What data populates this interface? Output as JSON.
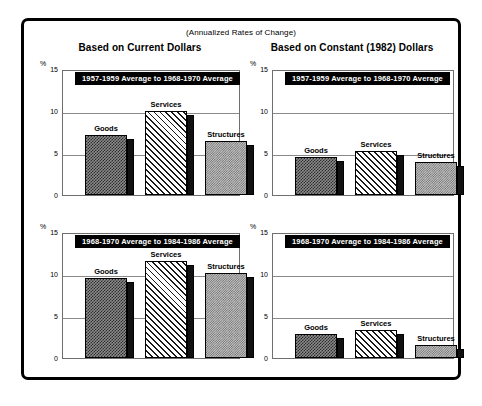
{
  "figure": {
    "subtitle": "(Annualized Rates of Change)",
    "column_headings": [
      "Based on Current Dollars",
      "Based on Constant (1982) Dollars"
    ]
  },
  "chart_data": [
    {
      "type": "bar",
      "panel_id": "current-1957-1968",
      "title": "1957-1959 Average to 1968-1970 Average",
      "column_heading": "Based on Current Dollars",
      "categories": [
        "Goods",
        "Services",
        "Structures"
      ],
      "values": [
        7.1,
        10.0,
        6.4
      ],
      "xlabel": "",
      "ylabel": "%",
      "ylim": [
        0,
        15
      ],
      "yticks": [
        0,
        5,
        10,
        15
      ],
      "ytick_labels": [
        "0",
        "5",
        "10",
        "15"
      ],
      "grid": true,
      "legend": "none"
    },
    {
      "type": "bar",
      "panel_id": "constant-1957-1968",
      "title": "1957-1959 Average to 1968-1970 Average",
      "column_heading": "Based on Constant (1982) Dollars",
      "categories": [
        "Goods",
        "Services",
        "Structures"
      ],
      "values": [
        4.5,
        5.2,
        3.9
      ],
      "xlabel": "",
      "ylabel": "%",
      "ylim": [
        0,
        15
      ],
      "yticks": [
        0,
        5,
        10,
        15
      ],
      "ytick_labels": [
        "0",
        "5",
        "10",
        "15"
      ],
      "grid": true,
      "legend": "none"
    },
    {
      "type": "bar",
      "panel_id": "current-1968-1984",
      "title": "1968-1970 Average to 1984-1986 Average",
      "column_heading": "Based on Current Dollars",
      "categories": [
        "Goods",
        "Services",
        "Structures"
      ],
      "values": [
        9.5,
        11.6,
        10.1
      ],
      "xlabel": "",
      "ylabel": "%",
      "ylim": [
        0,
        15
      ],
      "yticks": [
        0,
        5,
        10,
        15
      ],
      "ytick_labels": [
        "0",
        "5",
        "10",
        "15"
      ],
      "grid": true,
      "legend": "none"
    },
    {
      "type": "bar",
      "panel_id": "constant-1968-1984",
      "title": "1968-1970 Average to 1984-1986 Average",
      "column_heading": "Based on Constant (1982) Dollars",
      "categories": [
        "Goods",
        "Services",
        "Structures"
      ],
      "values": [
        2.8,
        3.3,
        1.5
      ],
      "xlabel": "",
      "ylabel": "%",
      "ylim": [
        0,
        15
      ],
      "yticks": [
        0,
        5,
        10,
        15
      ],
      "ytick_labels": [
        "0",
        "5",
        "10",
        "15"
      ],
      "grid": true,
      "legend": "none"
    }
  ],
  "style": {
    "background": "#ffffff",
    "border_color": "#000000",
    "banner_bg": "#000000",
    "banner_fg": "#ffffff",
    "grid_color": "#8a8a8a",
    "series_fills": {
      "Goods": "#8c8c8c",
      "Services": "#ffffff",
      "Structures": "#c2c2c2"
    }
  }
}
